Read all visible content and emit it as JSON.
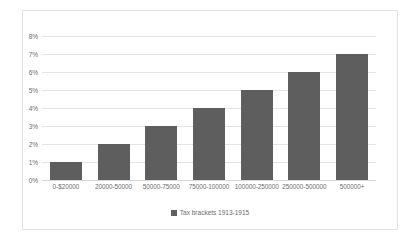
{
  "chart_data": {
    "type": "bar",
    "title": "",
    "subtitle": "",
    "xlabel": "",
    "ylabel": "",
    "categories": [
      "0-$20000",
      "20000-50000",
      "50000-75000",
      "75000-100000",
      "100000-250000",
      "250000-500000",
      "500000+"
    ],
    "values": [
      1,
      2,
      3,
      4,
      5,
      6,
      7
    ],
    "value_unit": "%",
    "series": [
      {
        "name": "Tax brackets 1913-1915",
        "values": [
          1,
          2,
          3,
          4,
          5,
          6,
          7
        ]
      }
    ],
    "ylim": [
      0,
      8
    ],
    "ytick_step": 1,
    "ytick_labels": [
      "0%",
      "1%",
      "2%",
      "3%",
      "4%",
      "5%",
      "6%",
      "7%",
      "8%"
    ],
    "grid": true,
    "grid_axis": "y",
    "legend": {
      "position": "bottom",
      "entries": [
        {
          "label": "Tax brackets 1913-1915",
          "color": "#5e5e5e"
        }
      ]
    },
    "colors": {
      "bar": "#5e5e5e",
      "gridline": "#e4e4e4",
      "axis_text": "#6d6d6d",
      "border": "#e2e2e2",
      "background": "#ffffff"
    }
  }
}
